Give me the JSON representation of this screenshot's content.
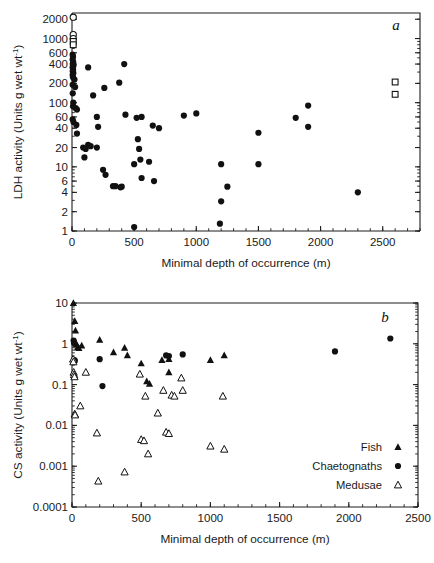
{
  "figure": {
    "width": 434,
    "height": 563,
    "background": "#ffffff",
    "ink_color": "#111111"
  },
  "chart_data": [
    {
      "type": "scatter",
      "panel_letter": "a",
      "title": "",
      "xlabel": "Minimal depth of occurrence (m)",
      "ylabel": "LDH activity (Units g wet wt",
      "ylabel_superscript": "-1",
      "ylabel_suffix": ")",
      "xlim": [
        0,
        2800
      ],
      "ylim": [
        1,
        2500
      ],
      "yscale": "log",
      "xscale": "linear",
      "grid": false,
      "legend": "none",
      "xticks": [
        0,
        500,
        1000,
        1500,
        2000,
        2500
      ],
      "xtick_labels": [
        "0",
        "500",
        "1000",
        "1500",
        "2000",
        "2500"
      ],
      "x_minor_step": 100,
      "yticks": [
        1,
        2,
        4,
        6,
        10,
        20,
        40,
        60,
        100,
        200,
        400,
        600,
        1000,
        2000
      ],
      "ytick_labels": [
        "1",
        "2",
        "4",
        "6",
        "10",
        "20",
        "40",
        "60",
        "100",
        "200",
        "400",
        "600",
        "1000",
        "2000"
      ],
      "series": [
        {
          "name": "filled-circles",
          "marker": "filled-circle",
          "points": [
            [
              5,
              560
            ],
            [
              8,
              520
            ],
            [
              5,
              470
            ],
            [
              10,
              430
            ],
            [
              6,
              400
            ],
            [
              12,
              380
            ],
            [
              5,
              355
            ],
            [
              9,
              330
            ],
            [
              6,
              310
            ],
            [
              11,
              290
            ],
            [
              5,
              270
            ],
            [
              8,
              250
            ],
            [
              20,
              230
            ],
            [
              5,
              190
            ],
            [
              25,
              175
            ],
            [
              6,
              140
            ],
            [
              10,
              100
            ],
            [
              8,
              88
            ],
            [
              30,
              82
            ],
            [
              40,
              78
            ],
            [
              5,
              55
            ],
            [
              12,
              50
            ],
            [
              35,
              45
            ],
            [
              40,
              33
            ],
            [
              90,
              20
            ],
            [
              110,
              19
            ],
            [
              130,
              22
            ],
            [
              150,
              21
            ],
            [
              100,
              14
            ],
            [
              130,
              355
            ],
            [
              170,
              130
            ],
            [
              200,
              60
            ],
            [
              200,
              20
            ],
            [
              210,
              42
            ],
            [
              250,
              9
            ],
            [
              260,
              170
            ],
            [
              270,
              7.5
            ],
            [
              330,
              5
            ],
            [
              350,
              5
            ],
            [
              390,
              4.8
            ],
            [
              400,
              4.9
            ],
            [
              380,
              205
            ],
            [
              420,
              400
            ],
            [
              430,
              65
            ],
            [
              500,
              1.15
            ],
            [
              500,
              11
            ],
            [
              520,
              58
            ],
            [
              530,
              27
            ],
            [
              540,
              19
            ],
            [
              550,
              13
            ],
            [
              560,
              60
            ],
            [
              560,
              6.7
            ],
            [
              620,
              12
            ],
            [
              650,
              44
            ],
            [
              660,
              6
            ],
            [
              700,
              40
            ],
            [
              900,
              63
            ],
            [
              1000,
              68
            ],
            [
              1190,
              1.3
            ],
            [
              1200,
              2.9
            ],
            [
              1200,
              11
            ],
            [
              1250,
              4.9
            ],
            [
              1500,
              11
            ],
            [
              1500,
              34
            ],
            [
              1800,
              58
            ],
            [
              1900,
              42
            ],
            [
              1900,
              90
            ],
            [
              2300,
              4
            ]
          ]
        },
        {
          "name": "open-circles",
          "marker": "open-circle",
          "points": [
            [
              10,
              2150
            ],
            [
              10,
              1150
            ],
            [
              10,
              1000
            ]
          ]
        },
        {
          "name": "open-squares",
          "marker": "open-square",
          "points": [
            [
              10,
              900
            ],
            [
              10,
              800
            ],
            [
              2600,
              210
            ],
            [
              2600,
              135
            ]
          ]
        }
      ]
    },
    {
      "type": "scatter",
      "panel_letter": "b",
      "title": "",
      "xlabel": "Minimal depth of occurrence (m)",
      "ylabel": "CS activity (Units g wet wt",
      "ylabel_superscript": "-1",
      "ylabel_suffix": ")",
      "xlim": [
        0,
        2500
      ],
      "ylim": [
        0.0001,
        10
      ],
      "yscale": "log",
      "xscale": "linear",
      "grid": false,
      "legend_position": "bottom-right",
      "xticks": [
        0,
        500,
        1000,
        1500,
        2000,
        2500
      ],
      "xtick_labels": [
        "0",
        "500",
        "1000",
        "1500",
        "2000",
        "2500"
      ],
      "x_minor_step": 100,
      "yticks": [
        0.0001,
        0.001,
        0.01,
        0.1,
        1,
        10
      ],
      "ytick_labels": [
        "0.0001",
        "0.001",
        "0.01",
        "0.1",
        "1",
        "10"
      ],
      "series": [
        {
          "name": "Fish",
          "marker": "filled-triangle",
          "points": [
            [
              10,
              10
            ],
            [
              20,
              3.6
            ],
            [
              25,
              2.1
            ],
            [
              30,
              1.0
            ],
            [
              35,
              0.95
            ],
            [
              40,
              0.82
            ],
            [
              50,
              0.78
            ],
            [
              70,
              0.9
            ],
            [
              200,
              1.25
            ],
            [
              300,
              0.62
            ],
            [
              380,
              0.8
            ],
            [
              400,
              0.52
            ],
            [
              500,
              0.33
            ],
            [
              540,
              0.12
            ],
            [
              560,
              0.105
            ],
            [
              650,
              0.4
            ],
            [
              700,
              0.42
            ],
            [
              700,
              0.2
            ],
            [
              1000,
              0.4
            ],
            [
              1100,
              0.52
            ]
          ]
        },
        {
          "name": "Chaetognaths",
          "marker": "filled-circle",
          "points": [
            [
              12,
              1.2
            ],
            [
              15,
              1.05
            ],
            [
              18,
              0.4
            ],
            [
              20,
              0.38
            ],
            [
              200,
              0.42
            ],
            [
              220,
              0.092
            ],
            [
              680,
              0.52
            ],
            [
              700,
              0.5
            ],
            [
              800,
              0.55
            ],
            [
              1900,
              0.65
            ],
            [
              2300,
              1.35
            ]
          ]
        },
        {
          "name": "Medusae",
          "marker": "open-triangle",
          "points": [
            [
              8,
              0.42
            ],
            [
              10,
              0.36
            ],
            [
              12,
              0.2
            ],
            [
              15,
              0.175
            ],
            [
              18,
              0.155
            ],
            [
              20,
              0.019
            ],
            [
              22,
              0.018
            ],
            [
              60,
              0.03
            ],
            [
              100,
              0.2
            ],
            [
              180,
              0.0065
            ],
            [
              190,
              0.00043
            ],
            [
              380,
              0.00072
            ],
            [
              490,
              0.18
            ],
            [
              500,
              0.0045
            ],
            [
              520,
              0.0042
            ],
            [
              530,
              0.052
            ],
            [
              550,
              0.002
            ],
            [
              620,
              0.02
            ],
            [
              660,
              0.072
            ],
            [
              680,
              0.0068
            ],
            [
              700,
              0.0063
            ],
            [
              720,
              0.055
            ],
            [
              740,
              0.052
            ],
            [
              790,
              0.145
            ],
            [
              800,
              0.072
            ],
            [
              1000,
              0.0031
            ],
            [
              1090,
              0.052
            ],
            [
              1100,
              0.0026
            ]
          ]
        }
      ],
      "legend_entries": [
        {
          "label": "Fish",
          "marker": "filled-triangle"
        },
        {
          "label": "Chaetognaths",
          "marker": "filled-circle"
        },
        {
          "label": "Medusae",
          "marker": "open-triangle"
        }
      ]
    }
  ]
}
